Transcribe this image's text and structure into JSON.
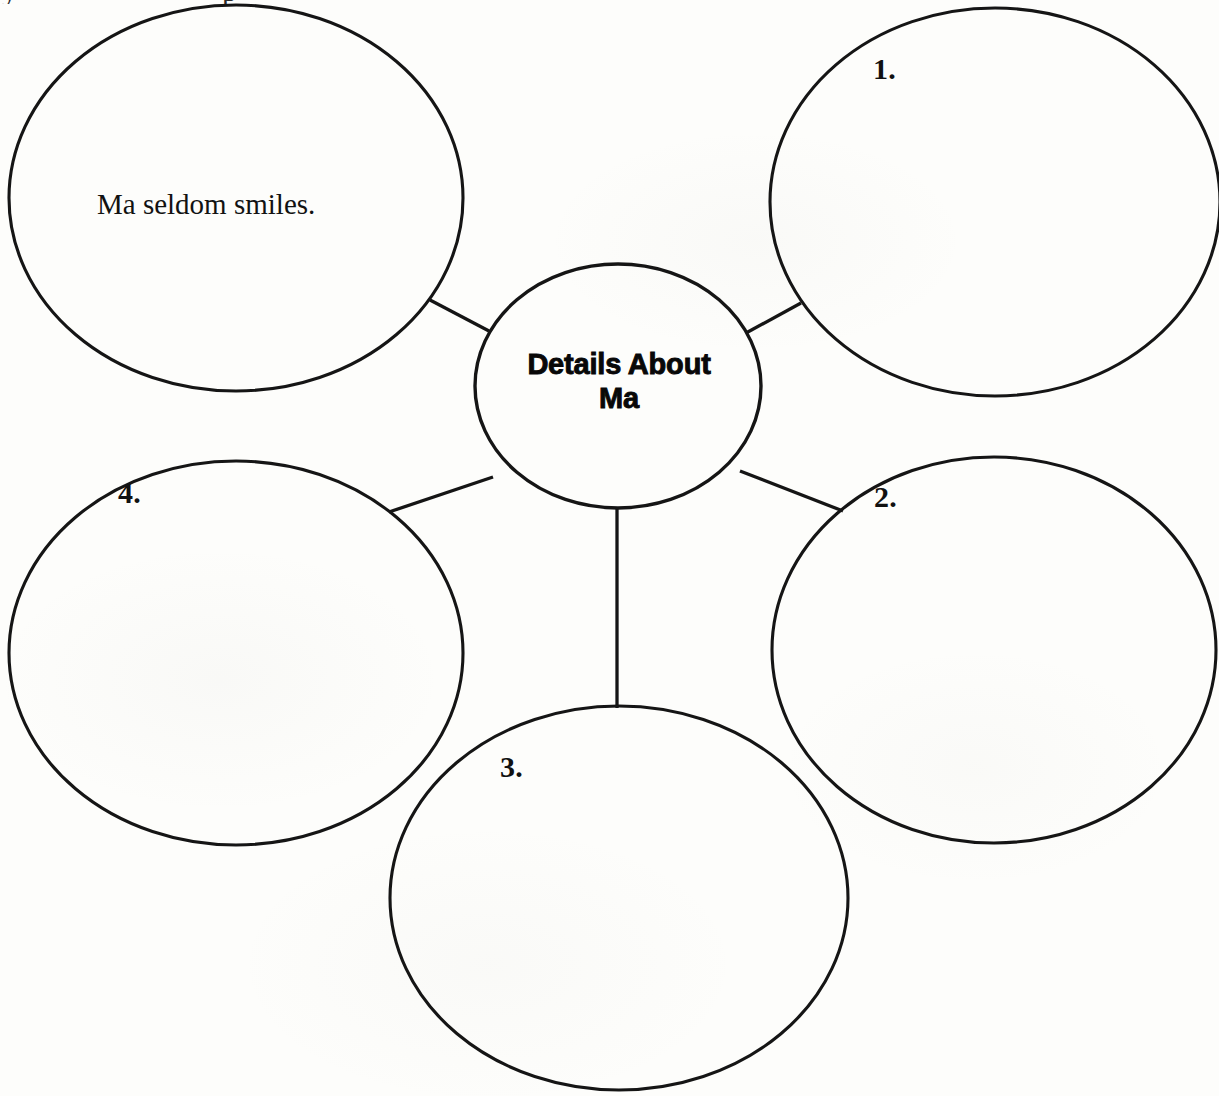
{
  "document": {
    "type": "web-graphic-organizer",
    "page_background_color": "#fdfdfb",
    "ink_color": "#151515"
  },
  "center_node": {
    "label_line_1": "Details About",
    "label_line_2": "Ma",
    "full_label": "Details About Ma"
  },
  "clipped_header_fragments": {
    "fragment_left": "y",
    "fragment_right": "p"
  },
  "nodes": [
    {
      "id": "node-filled-example",
      "position": "top-left",
      "number": "",
      "text": "Ma seldom smiles.",
      "filled": true
    },
    {
      "id": "node-1",
      "position": "top-right",
      "number": "1.",
      "text": "",
      "filled": false
    },
    {
      "id": "node-2",
      "position": "right",
      "number": "2.",
      "text": "",
      "filled": false
    },
    {
      "id": "node-3",
      "position": "bottom",
      "number": "3.",
      "text": "",
      "filled": false
    },
    {
      "id": "node-4",
      "position": "left",
      "number": "4.",
      "text": "",
      "filled": false
    }
  ]
}
